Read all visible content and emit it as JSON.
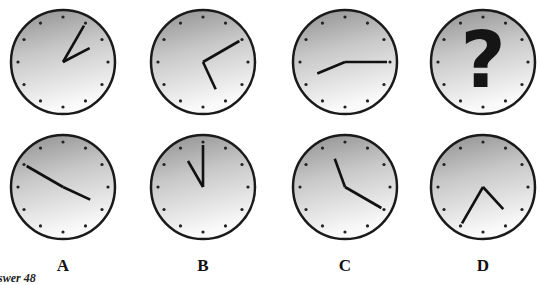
{
  "puzzle": {
    "columns": [
      "A",
      "B",
      "C",
      "D"
    ],
    "caption": "swer 48",
    "top_row": [
      {
        "label": "A",
        "hour": 2,
        "minute": 5,
        "unknown": false
      },
      {
        "label": "B",
        "hour": 5,
        "minute": 10,
        "unknown": false
      },
      {
        "label": "C",
        "hour": 8,
        "minute": 15,
        "unknown": false
      },
      {
        "label": "D",
        "unknown": true,
        "symbol": "?"
      }
    ],
    "bottom_row": [
      {
        "label": "A",
        "hour": 3,
        "minute": 50
      },
      {
        "label": "B",
        "hour": 11,
        "minute": 0
      },
      {
        "label": "C",
        "hour": 11,
        "minute": 20
      },
      {
        "label": "D",
        "hour": 4,
        "minute": 35
      }
    ]
  },
  "colors": {
    "face_dark": "#9a9a9a",
    "face_light": "#f4f4f4",
    "rim": "#1a1a1a",
    "hand": "#111111",
    "question_mark": "#151515"
  }
}
